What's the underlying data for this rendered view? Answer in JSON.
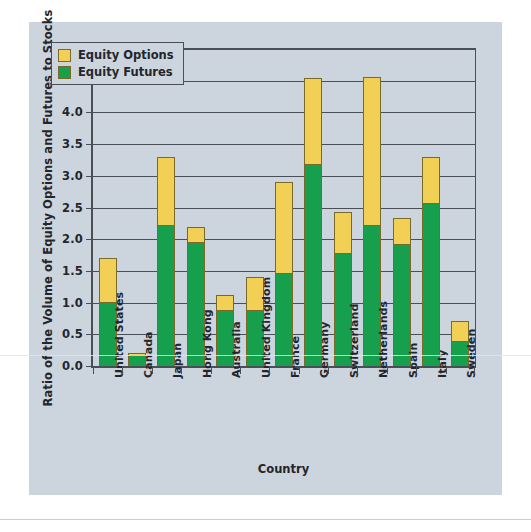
{
  "chart_data": {
    "type": "bar",
    "subtype": "stacked-vertical",
    "title": "",
    "xlabel": "Country",
    "ylabel": "Ratio of the Volume of Equity Options and Futures to Stocks",
    "ylim": [
      0.0,
      5.0
    ],
    "ytick_step": 0.5,
    "ytick_labels": [
      "0.0",
      "0.5",
      "1.0",
      "1.5",
      "2.0",
      "2.5",
      "3.0",
      "3.5",
      "4.0",
      "4.5",
      "5.0"
    ],
    "grid": true,
    "legend_position": "top-left",
    "categories": [
      "United States",
      "Canada",
      "Japan",
      "Hong Kong",
      "Australia",
      "United Kingdom",
      "France",
      "Germany",
      "Switzerland",
      "Netherlands",
      "Spain",
      "Italy",
      "Sweden"
    ],
    "series": [
      {
        "name": "Equity Futures",
        "color": "#16a04e",
        "values": [
          1.01,
          0.18,
          2.23,
          1.96,
          0.88,
          0.88,
          1.46,
          3.18,
          1.78,
          2.22,
          1.92,
          2.57,
          0.4
        ]
      },
      {
        "name": "Equity Options",
        "color": "#f2d055",
        "values": [
          0.69,
          0.03,
          1.07,
          0.24,
          0.24,
          0.53,
          1.45,
          1.37,
          0.65,
          2.34,
          0.42,
          0.72,
          0.31
        ]
      }
    ],
    "totals": [
      1.7,
      0.21,
      3.3,
      2.2,
      1.12,
      1.41,
      2.91,
      4.55,
      2.43,
      4.56,
      2.34,
      3.29,
      0.71
    ],
    "colors": {
      "background": "#ccd4dd",
      "page": "#ffffff",
      "axis": "#4a4f57",
      "text": "#22262b",
      "equity_options": "#f2d055",
      "equity_futures": "#16a04e"
    }
  },
  "legend": {
    "entries": [
      {
        "label": "Equity Options",
        "swatch": "options"
      },
      {
        "label": "Equity Futures",
        "swatch": "futures"
      }
    ]
  },
  "axes": {
    "x_title": "Country",
    "y_title": "Ratio of the Volume of Equity Options and Futures to Stocks"
  }
}
